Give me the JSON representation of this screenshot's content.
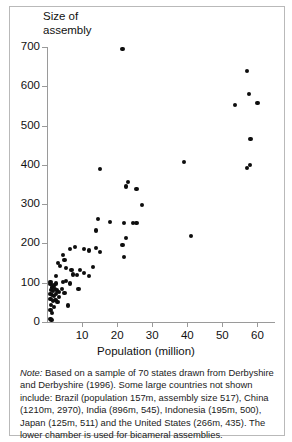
{
  "figure": {
    "y_axis_title": "Size of\nassembly",
    "x_axis_title": "Population (million)",
    "note_label": "Note:",
    "note_text": "  Based on a sample of 70 states drawn from Derbyshire and Derbyshire (1996). Some large countries not shown include: Brazil (population 157m, assembly size 517), China (1210m, 2970), India (896m, 545), Indonesia (195m, 500), Japan (125m, 511) and the United States (266m, 435). The lower chamber is used for bicameral assemblies."
  },
  "chart_data": {
    "type": "scatter",
    "title": "Size of assembly",
    "xlabel": "Population (million)",
    "ylabel": "Size of assembly",
    "xlim": [
      0,
      65
    ],
    "ylim": [
      0,
      700
    ],
    "xticks": [
      10,
      20,
      30,
      40,
      50,
      60
    ],
    "yticks": [
      0,
      100,
      200,
      300,
      400,
      500,
      600,
      700
    ],
    "grid": false,
    "legend": null,
    "marker_color": "#0d0d0d",
    "axis_color": "#9a9a9a",
    "points": [
      [
        21.5,
        695
      ],
      [
        57.0,
        638
      ],
      [
        57.5,
        580
      ],
      [
        60.0,
        558
      ],
      [
        53.5,
        552
      ],
      [
        58.0,
        466
      ],
      [
        39.0,
        407
      ],
      [
        15.0,
        389
      ],
      [
        57.8,
        400
      ],
      [
        57.0,
        391
      ],
      [
        22.5,
        345
      ],
      [
        23.0,
        357
      ],
      [
        25.5,
        338
      ],
      [
        27.0,
        297
      ],
      [
        41.0,
        219
      ],
      [
        14.5,
        262
      ],
      [
        14.0,
        233
      ],
      [
        18.0,
        255
      ],
      [
        22.0,
        253
      ],
      [
        24.5,
        253
      ],
      [
        25.5,
        253
      ],
      [
        22.5,
        214
      ],
      [
        21.5,
        196
      ],
      [
        22.0,
        166
      ],
      [
        10.5,
        185
      ],
      [
        6.5,
        186
      ],
      [
        12.0,
        182
      ],
      [
        14.0,
        188
      ],
      [
        15.0,
        178
      ],
      [
        8.0,
        190
      ],
      [
        4.5,
        170
      ],
      [
        3.2,
        150
      ],
      [
        3.8,
        143
      ],
      [
        5.0,
        158
      ],
      [
        5.5,
        137
      ],
      [
        7.0,
        133
      ],
      [
        9.5,
        133
      ],
      [
        13.0,
        140
      ],
      [
        10.5,
        125
      ],
      [
        12.0,
        118
      ],
      [
        8.5,
        120
      ],
      [
        7.5,
        121
      ],
      [
        2.5,
        118
      ],
      [
        1.0,
        102
      ],
      [
        1.0,
        96
      ],
      [
        1.5,
        88
      ],
      [
        2.0,
        93
      ],
      [
        2.5,
        98
      ],
      [
        4.5,
        101
      ],
      [
        5.5,
        104
      ],
      [
        6.5,
        98
      ],
      [
        1.2,
        82
      ],
      [
        1.8,
        78
      ],
      [
        2.2,
        84
      ],
      [
        2.8,
        80
      ],
      [
        3.5,
        76
      ],
      [
        4.2,
        85
      ],
      [
        1.0,
        72
      ],
      [
        1.4,
        68
      ],
      [
        2.0,
        66
      ],
      [
        2.6,
        71
      ],
      [
        3.4,
        64
      ],
      [
        5.0,
        74
      ],
      [
        9.0,
        85
      ],
      [
        1.0,
        58
      ],
      [
        1.6,
        54
      ],
      [
        2.4,
        57
      ],
      [
        3.0,
        50
      ],
      [
        6.0,
        42
      ],
      [
        1.2,
        44
      ],
      [
        2.0,
        38
      ],
      [
        1.0,
        30
      ],
      [
        1.5,
        22
      ],
      [
        1.0,
        8
      ],
      [
        1.3,
        5
      ]
    ]
  }
}
